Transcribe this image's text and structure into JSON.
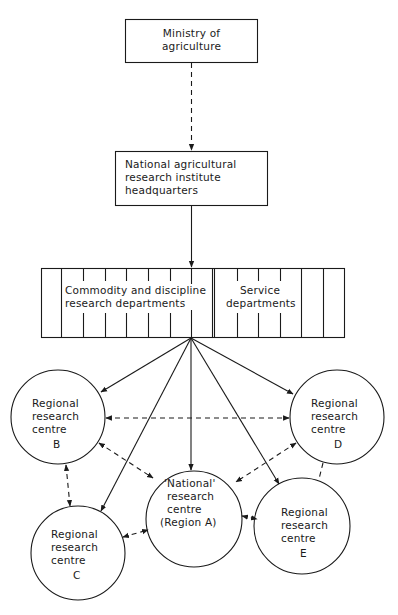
{
  "nodes": {
    "ministry": {
      "line1": "Ministry of",
      "line2": "agriculture"
    },
    "headquarters": {
      "line1": "National agricultural",
      "line2": "research institute",
      "line3": "headquarters"
    },
    "research_departments": {
      "line1": "Commodity and discipline",
      "line2": "research departments"
    },
    "service_departments": {
      "line1": "Service",
      "line2": "departments"
    },
    "centre_b": {
      "line1": "Regional",
      "line2": "research",
      "line3": "centre",
      "letter": "B"
    },
    "centre_d": {
      "line1": "Regional",
      "line2": "research",
      "line3": "centre",
      "letter": "D"
    },
    "centre_a": {
      "line1": "'National'",
      "line2": "research",
      "line3": "centre",
      "line4": "(Region A)"
    },
    "centre_c": {
      "line1": "Regional",
      "line2": "research",
      "line3": "centre",
      "letter": "C"
    },
    "centre_e": {
      "line1": "Regional",
      "line2": "research",
      "line3": "centre",
      "letter": "E"
    }
  },
  "colors": {
    "stroke": "#1a1a1a",
    "background": "#ffffff"
  }
}
